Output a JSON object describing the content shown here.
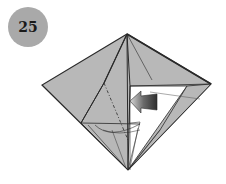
{
  "step": {
    "number": "25",
    "badge_color": "#a9a9a9"
  },
  "diagram": {
    "paper_color": "#b8b8b8",
    "inner_color": "#ffffff",
    "line_color": "#2a2a2a",
    "arrow_color": "#444444",
    "arrow_direction": "left",
    "fold_type": "inside-reverse / push-in"
  }
}
